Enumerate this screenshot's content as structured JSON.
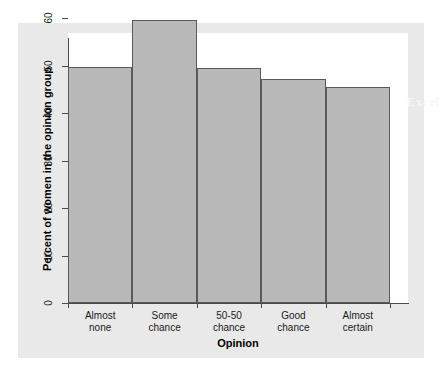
{
  "figure": {
    "watermark_text": "Excel",
    "panel_color": "#e9e9e9",
    "plot_background": "#ffffff",
    "bar_fill_color": "#b9b9b9",
    "bar_edge_color": "#5a5a5a",
    "axis_color": "#4a4a4a"
  },
  "chart_data": {
    "type": "bar",
    "title": "",
    "subtitle": "",
    "xlabel": "Opinion",
    "ylabel": "Percent of women in the opinion group",
    "categories": [
      "Almost none",
      "Some chance",
      "50-50 chance",
      "Good chance",
      "Almost certain"
    ],
    "category_lines": [
      [
        "Almost",
        "none"
      ],
      [
        "Some",
        "chance"
      ],
      [
        "50-50",
        "chance"
      ],
      [
        "Good",
        "chance"
      ],
      [
        "Almost",
        "certain"
      ]
    ],
    "values": [
      49.7,
      59.7,
      49.5,
      47.2,
      45.5
    ],
    "ylim": [
      0,
      62
    ],
    "yticks": [
      0,
      10,
      20,
      30,
      40,
      50,
      60
    ],
    "ytick_labels": [
      "0",
      "10",
      "20",
      "30",
      "40",
      "50",
      "60"
    ],
    "grid": false,
    "legend": null,
    "bar_gap": 0
  }
}
